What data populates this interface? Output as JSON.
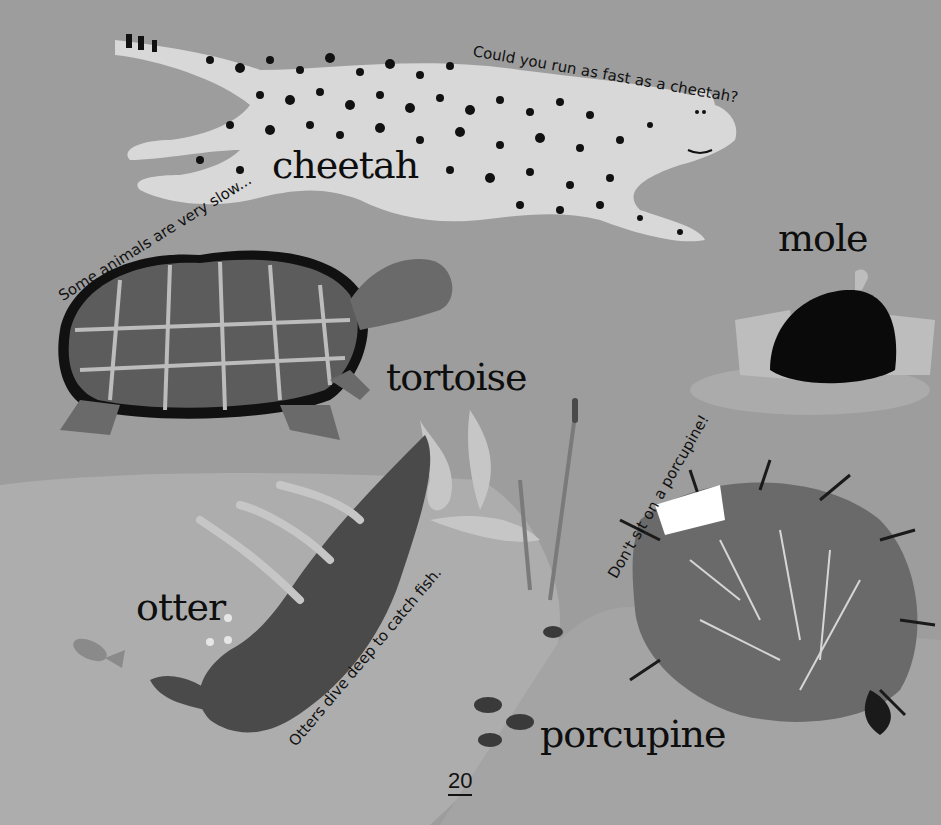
{
  "page": {
    "page_number": "20",
    "colors": {
      "background": "#9d9d9d",
      "water": "#adadad",
      "cheetah_body": "#d8d8d8",
      "spots": "#111111",
      "tortoise_shell": "#5a5a5a",
      "otter": "#4a4a4a",
      "porcupine": "#6a6a6a",
      "mole": "#0a0a0a"
    }
  },
  "animals": [
    {
      "name": "cheetah",
      "caption": "Could you run as fast as a cheetah?"
    },
    {
      "name": "tortoise",
      "caption": "Some animals are very slow..."
    },
    {
      "name": "mole",
      "caption": ""
    },
    {
      "name": "otter",
      "caption": "Otters dive deep to catch fish."
    },
    {
      "name": "porcupine",
      "caption": "Don't sit on a porcupine!"
    }
  ]
}
